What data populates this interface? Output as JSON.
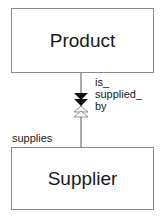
{
  "diagram": {
    "type": "entity-relationship",
    "entities": [
      {
        "id": "product",
        "label": "Product"
      },
      {
        "id": "supplier",
        "label": "Supplier"
      }
    ],
    "relationship": {
      "from": "Product",
      "to": "Supplier",
      "role_top_lines": [
        "is_",
        "supplied_",
        "by"
      ],
      "role_bottom": "supplies",
      "end_product_side": "filled double arrowhead (down)",
      "end_supplier_side": "hollow double arrowhead (up)"
    },
    "colors": {
      "border": "#8a8a8a",
      "line": "#555555",
      "text": "#1a1a1a",
      "arrow_fill": "#111111"
    }
  }
}
